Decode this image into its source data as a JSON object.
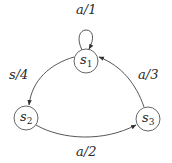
{
  "diagram": {
    "type": "finite-state-machine",
    "states": [
      {
        "id": "s1",
        "name": "s",
        "subscript": "1",
        "cx": 86,
        "cy": 61,
        "r": 12
      },
      {
        "id": "s2",
        "name": "s",
        "subscript": "2",
        "cx": 26,
        "cy": 118,
        "r": 12
      },
      {
        "id": "s3",
        "name": "s",
        "subscript": "3",
        "cx": 148,
        "cy": 119,
        "r": 12
      }
    ],
    "transitions": [
      {
        "from": "s1",
        "to": "s1",
        "label": "a/1"
      },
      {
        "from": "s1",
        "to": "s2",
        "label": "s/4"
      },
      {
        "from": "s2",
        "to": "s3",
        "label": "a/2"
      },
      {
        "from": "s3",
        "to": "s1",
        "label": "a/3"
      }
    ],
    "colors": {
      "node_stroke": "#555555",
      "edge_stroke": "#444444",
      "text": "#2a2a2a",
      "background": "#ffffff"
    }
  },
  "labels": {
    "s1_s1": "a/1",
    "s1_s2": "s/4",
    "s2_s3": "a/2",
    "s3_s1": "a/3",
    "s1_main": "s",
    "s1_sub": "1",
    "s2_main": "s",
    "s2_sub": "2",
    "s3_main": "s",
    "s3_sub": "3"
  }
}
